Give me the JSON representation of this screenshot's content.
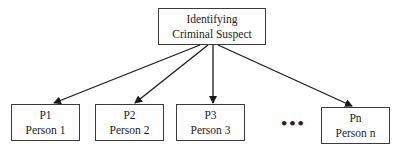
{
  "diagram": {
    "type": "tree",
    "root": {
      "line1": "Identifying",
      "line2": "Criminal Suspect"
    },
    "children": [
      {
        "id": "P1",
        "label": "Person 1"
      },
      {
        "id": "P2",
        "label": "Person 2"
      },
      {
        "id": "P3",
        "label": "Person 3"
      },
      {
        "id": "Pn",
        "label": "Person n"
      }
    ],
    "ellipsis": "•••",
    "edges": [
      {
        "from": "root",
        "to": "P1"
      },
      {
        "from": "root",
        "to": "P2"
      },
      {
        "from": "root",
        "to": "P3"
      },
      {
        "from": "root",
        "to": "Pn"
      }
    ],
    "colors": {
      "line": "#1a1a1a",
      "box_border": "#3a3a3a",
      "background": "#ffffff"
    }
  }
}
